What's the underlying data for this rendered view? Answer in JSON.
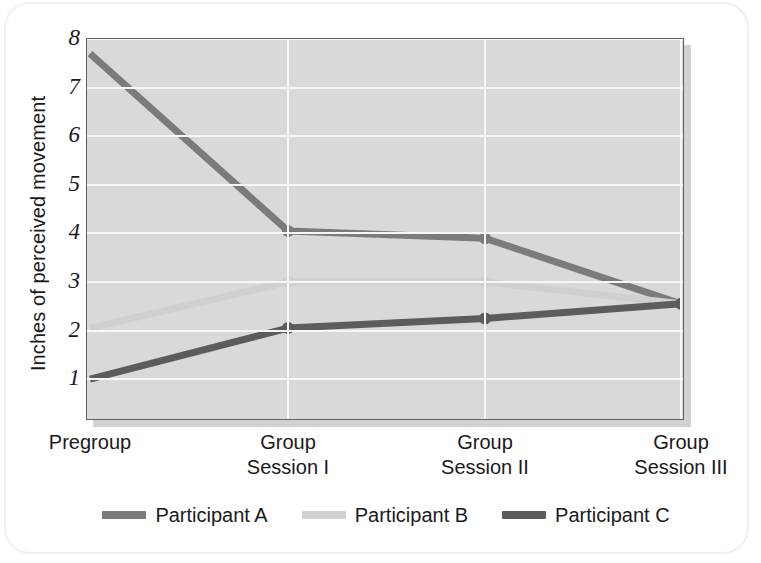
{
  "figure": {
    "background_color": "#ffffff",
    "plot_background_color": "#d9d9d9",
    "plot_border_color": "#5f5f5f",
    "gridline_color": "#f7f7f7"
  },
  "axes": {
    "ylabel": "Inches of perceived movement",
    "yticks": [
      "1",
      "2",
      "3",
      "4",
      "5",
      "6",
      "7",
      "8"
    ],
    "xticks": [
      {
        "line1": "Pregroup",
        "line2": ""
      },
      {
        "line1": "Group",
        "line2": "Session I"
      },
      {
        "line1": "Group",
        "line2": "Session II"
      },
      {
        "line1": "Group",
        "line2": "Session III"
      }
    ]
  },
  "legend": [
    {
      "label": "Participant A",
      "color": "#7b7b7b"
    },
    {
      "label": "Participant B",
      "color": "#d0d0d0"
    },
    {
      "label": "Participant C",
      "color": "#5c5c5c"
    }
  ],
  "chart_data": {
    "type": "line",
    "title": "",
    "xlabel": "",
    "ylabel": "Inches of perceived movement",
    "categories": [
      "Pregroup",
      "Group Session I",
      "Group Session II",
      "Group Session III"
    ],
    "ylim": [
      0.2,
      8.0
    ],
    "yticks": [
      1,
      2,
      3,
      4,
      5,
      6,
      7,
      8
    ],
    "grid": "both",
    "legend_position": "bottom-center",
    "markers": "filled-circle",
    "series": [
      {
        "name": "Participant A",
        "color": "#7b7b7b",
        "values": [
          7.7,
          4.05,
          3.9,
          2.55
        ]
      },
      {
        "name": "Participant B",
        "color": "#d0d0d0",
        "values": [
          2.05,
          3.0,
          3.0,
          2.55
        ]
      },
      {
        "name": "Participant C",
        "color": "#5c5c5c",
        "values": [
          1.0,
          2.05,
          2.25,
          2.55
        ]
      }
    ]
  }
}
